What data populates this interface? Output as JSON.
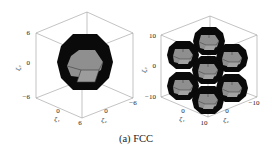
{
  "figure": {
    "caption": "(a) FCC",
    "colors": {
      "background": "#ffffff",
      "box_edge": "#9a9a9a",
      "polyhedron_shell": "#0a0a0a",
      "polyhedron_face": "#8a8a8a",
      "polyhedron_face_light": "#9e9e9e",
      "face_edge": "#3a3a3a"
    },
    "panels": [
      {
        "id": "left",
        "description": "Single truncated octahedron (first Brillouin zone, FCC) inside 3D box",
        "axes": {
          "z_label": "ζ₃",
          "x_label": "ζ₁",
          "y_label": "ζ₂",
          "z_ticks": [
            "6",
            "0",
            "−6"
          ],
          "x_ticks": [
            "0",
            "6"
          ],
          "y_ticks": [
            "0",
            "−6"
          ],
          "range": [
            -6,
            6
          ]
        },
        "polyhedra_count": 1
      },
      {
        "id": "right",
        "description": "Seven truncated octahedra in hexagonal arrangement (FCC lattice tiling) inside 3D box",
        "axes": {
          "z_label": "ζ₃",
          "x_label": "ζ₁",
          "y_label": "ζ₂",
          "z_ticks": [
            "10",
            "0",
            "−10"
          ],
          "x_ticks": [
            "0",
            "10"
          ],
          "y_ticks": [
            "0",
            "−10"
          ],
          "range": [
            -10,
            10
          ]
        },
        "polyhedra_count": 7
      }
    ]
  }
}
